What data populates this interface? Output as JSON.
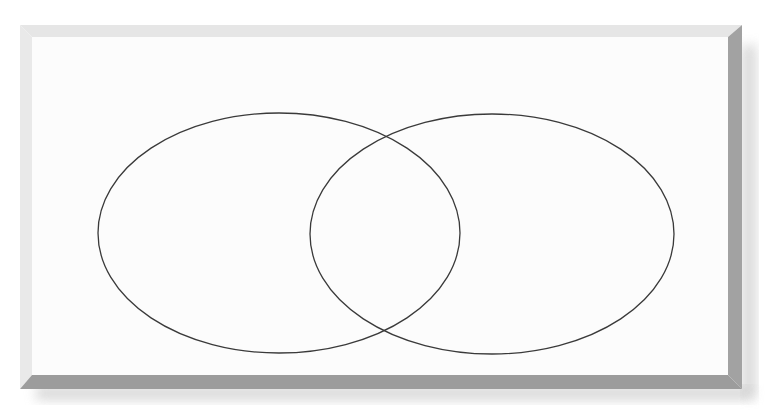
{
  "diagram": {
    "type": "venn",
    "sets": 2,
    "labels": [],
    "frame": {
      "face_color": "#fcfcfc",
      "light_bevel_color": "#e4e4e4",
      "dark_bevel_color": "#9e9e9e",
      "shadow_color": "#c8c8c8"
    },
    "circles": [
      {
        "name": "left-set",
        "cx": 279,
        "cy": 233,
        "rx": 181,
        "ry": 120,
        "stroke": "#3a3a3a"
      },
      {
        "name": "right-set",
        "cx": 492,
        "cy": 234,
        "rx": 182,
        "ry": 120,
        "stroke": "#3a3a3a"
      }
    ]
  }
}
